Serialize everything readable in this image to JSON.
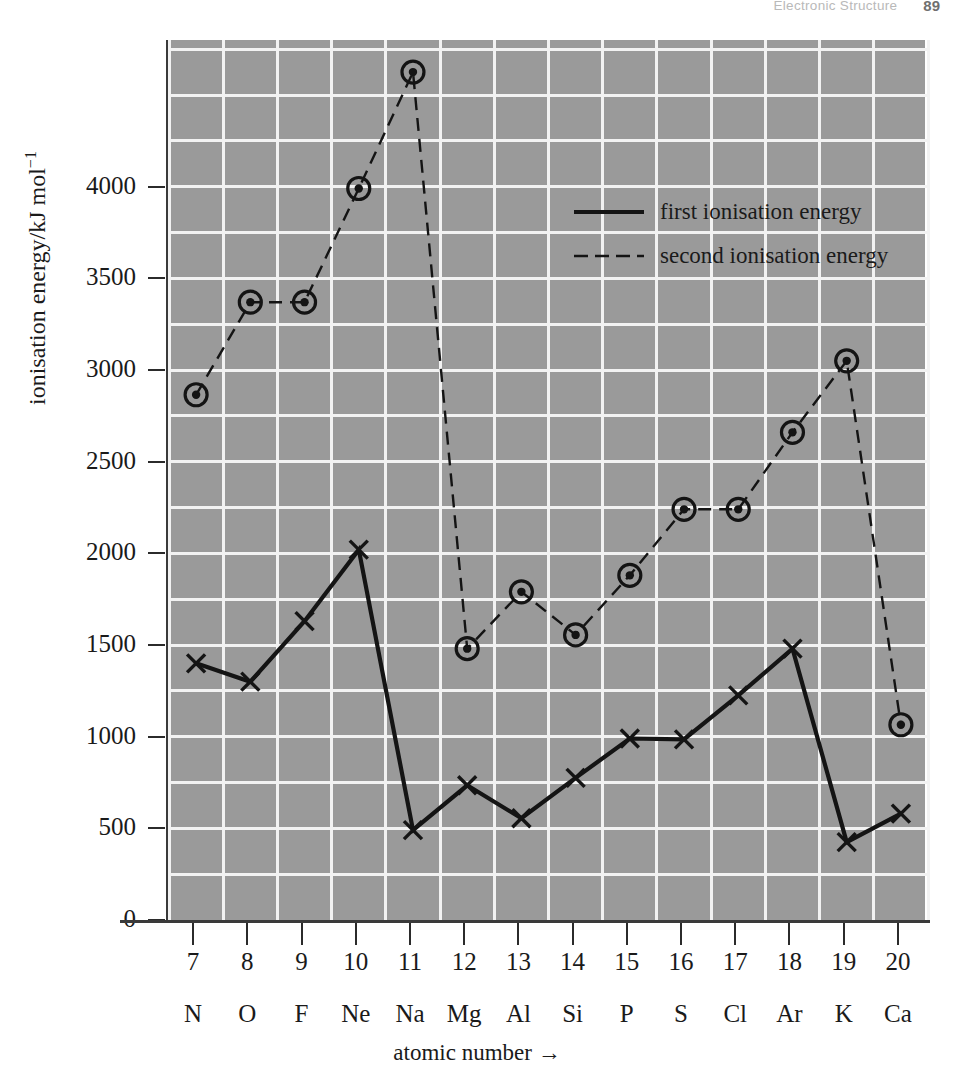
{
  "running_head": {
    "title": "Electronic Structure",
    "page_number": "89"
  },
  "chart_data": {
    "type": "line",
    "title": "",
    "xlabel": "atomic number →",
    "ylabel": "ionisation energy/kJ mol⁻¹",
    "ylabel_base": "ionisation energy/kJ mol",
    "ylabel_exponent": "−1",
    "x": [
      7,
      8,
      9,
      10,
      11,
      12,
      13,
      14,
      15,
      16,
      17,
      18,
      19,
      20
    ],
    "categories": [
      "N",
      "O",
      "F",
      "Ne",
      "Na",
      "Mg",
      "Al",
      "Si",
      "P",
      "S",
      "Cl",
      "Ar",
      "K",
      "Ca"
    ],
    "xtick_labels": [
      "7",
      "8",
      "9",
      "10",
      "11",
      "12",
      "13",
      "14",
      "15",
      "16",
      "17",
      "18",
      "19",
      "20"
    ],
    "ytick_labels": [
      "0",
      "500",
      "1000",
      "1500",
      "2000",
      "2500",
      "3000",
      "3500",
      "4000"
    ],
    "yticks": [
      0,
      500,
      1000,
      1500,
      2000,
      2500,
      3000,
      3500,
      4000
    ],
    "ylim": [
      0,
      4800
    ],
    "xlim": [
      6.5,
      20.5
    ],
    "grid": true,
    "grid_minor_step": 250,
    "legend_position": "upper-right-inside",
    "series": [
      {
        "name": "first ionisation energy",
        "linestyle": "solid",
        "marker": "x",
        "values": [
          1400,
          1300,
          1630,
          2020,
          490,
          735,
          555,
          775,
          990,
          985,
          1225,
          1480,
          425,
          580
        ]
      },
      {
        "name": "second ionisation energy",
        "linestyle": "dashed",
        "marker": "circle-dot",
        "values": [
          2865,
          3370,
          3370,
          3990,
          4625,
          1480,
          1790,
          1555,
          1880,
          2240,
          2240,
          2660,
          3050,
          1065
        ]
      }
    ]
  },
  "legend": {
    "items": [
      {
        "label": "first ionisation energy",
        "style": "solid"
      },
      {
        "label": "second ionisation energy",
        "style": "dashed"
      }
    ]
  },
  "colors": {
    "plot_background": "#9a9a9a",
    "gridline": "#f2f2f2",
    "axis": "#2b2b2b",
    "series_line": "#141414",
    "page_background": "#ffffff"
  }
}
